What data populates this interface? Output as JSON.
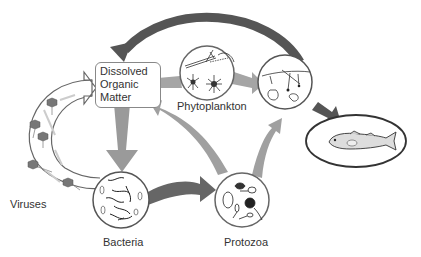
{
  "diagram": {
    "nodes": {
      "dom": {
        "line1": "Dissolved",
        "line2": "Organic",
        "line3": "Matter"
      },
      "phytoplankton": {
        "label": "Phytoplankton"
      },
      "zooplankton": {
        "label": ""
      },
      "fish": {
        "label": ""
      },
      "viruses": {
        "label": "Viruses"
      },
      "bacteria": {
        "label": "Bacteria"
      },
      "protozoa": {
        "label": "Protozoa"
      }
    },
    "edges": [
      {
        "from": "zooplankton",
        "to": "dom",
        "style": "dark-arc"
      },
      {
        "from": "phytoplankton",
        "to": "dom",
        "style": "gray"
      },
      {
        "from": "phytoplankton",
        "to": "zooplankton",
        "style": "gray"
      },
      {
        "from": "zooplankton",
        "to": "fish",
        "style": "dark"
      },
      {
        "from": "dom",
        "to": "bacteria",
        "style": "gray"
      },
      {
        "from": "bacteria",
        "to": "protozoa",
        "style": "dark"
      },
      {
        "from": "protozoa",
        "to": "dom",
        "style": "gray"
      },
      {
        "from": "protozoa",
        "to": "zooplankton",
        "style": "gray"
      },
      {
        "from": "viruses",
        "to": "dom",
        "style": "outline"
      }
    ],
    "colors": {
      "dark_arrow": "#555555",
      "gray_arrow": "#9a9a9a",
      "outline": "#666666"
    }
  }
}
